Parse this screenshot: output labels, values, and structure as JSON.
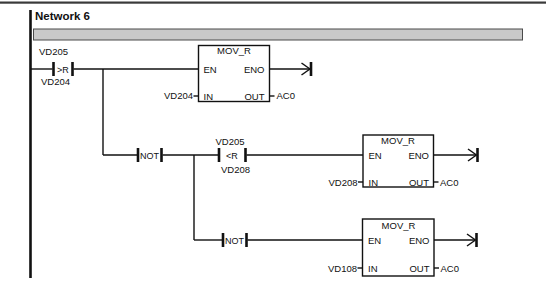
{
  "meta": {
    "editor": "ladder-network-editor",
    "bg_color": "#ffffff",
    "line_color": "#111111",
    "comment_bar_fill": "#c9c9c9",
    "comment_bar_border": "#4a4a4a"
  },
  "network": {
    "title": "Network 6"
  },
  "rungs": {
    "rung1": {
      "compare_contact": {
        "top_operand": "VD205",
        "operator": ">R",
        "bottom_operand": "VD204"
      },
      "mov_box": {
        "title": "MOV_R",
        "en_label": "EN",
        "eno_label": "ENO",
        "in_label": "IN",
        "out_label": "OUT",
        "in_operand": "VD204",
        "out_operand": "AC0"
      }
    },
    "rung2": {
      "not_contact": {
        "label": "NOT"
      },
      "compare_contact": {
        "top_operand": "VD205",
        "operator": "<R",
        "bottom_operand": "VD208"
      },
      "mov_box": {
        "title": "MOV_R",
        "en_label": "EN",
        "eno_label": "ENO",
        "in_label": "IN",
        "out_label": "OUT",
        "in_operand": "VD208",
        "out_operand": "AC0"
      }
    },
    "rung3": {
      "not_contact": {
        "label": "NOT"
      },
      "mov_box": {
        "title": "MOV_R",
        "en_label": "EN",
        "eno_label": "ENO",
        "in_label": "IN",
        "out_label": "OUT",
        "in_operand": "VD108",
        "out_operand": "AC0"
      }
    }
  }
}
